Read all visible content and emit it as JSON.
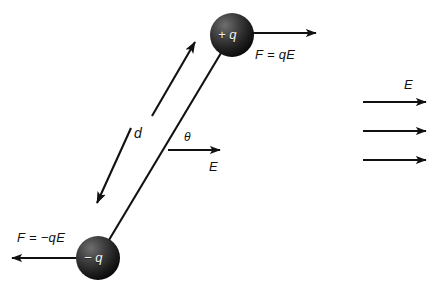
{
  "figure": {
    "background_color": "#ffffff",
    "ink_color": "#111111",
    "charge_label_color": "#f2f2f2",
    "width": 439,
    "height": 288
  },
  "charges": [
    {
      "name": "positive-charge",
      "label": "+ q",
      "sign": "+",
      "cx": 232,
      "cy": 35,
      "r": 22
    },
    {
      "name": "negative-charge",
      "label": "− q",
      "sign": "−",
      "cx": 98,
      "cy": 258,
      "r": 22
    }
  ],
  "labels": {
    "force_positive": "F = qE",
    "force_negative": "F = −qE",
    "separation": "d",
    "angle": "θ",
    "field_center": "E",
    "field_right": "E"
  },
  "field_lines": {
    "count": 3,
    "x_start": 363,
    "x_end": 428,
    "y_values": [
      102,
      131,
      160
    ],
    "label": "E"
  },
  "geometry": {
    "dipole_axis": {
      "x1": 98,
      "y1": 258,
      "x2": 232,
      "y2": 35
    },
    "separation_arrow": {
      "x1": 95,
      "y1": 205,
      "x2": 197,
      "y2": 40,
      "double_headed": true
    },
    "angle_vertex": {
      "x": 168,
      "y": 150
    },
    "center_field_arrow": {
      "x1": 168,
      "y1": 150,
      "x2": 222,
      "y2": 150
    },
    "force_positive_arrow": {
      "x1": 253,
      "y1": 33,
      "x2": 318,
      "y2": 33
    },
    "force_negative_arrow": {
      "x1": 78,
      "y1": 258,
      "x2": 10,
      "y2": 258
    }
  }
}
